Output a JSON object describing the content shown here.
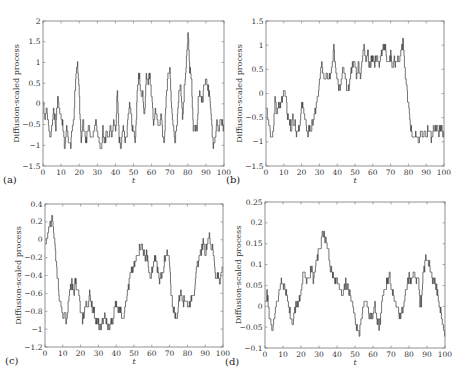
{
  "figure": {
    "panels": [
      "a",
      "b",
      "c",
      "d"
    ]
  },
  "chart_data": [
    {
      "type": "line",
      "panel_label": "(a)",
      "title": "",
      "xlabel": "t",
      "ylabel": "Diffusion-scaled process",
      "xlim": [
        0,
        100
      ],
      "ylim": [
        -1.5,
        2
      ],
      "xticks": [
        0,
        10,
        20,
        30,
        40,
        50,
        60,
        70,
        80,
        90,
        100
      ],
      "yticks": [
        -1.5,
        -1,
        -0.5,
        0,
        0.5,
        1,
        1.5,
        2
      ],
      "ytick_labels": [
        "-1.5",
        "-1",
        "-0.5",
        "0",
        "0.5",
        "1",
        "1.5",
        "2"
      ],
      "grid": false,
      "frame": [
        43,
        21,
        224,
        166
      ],
      "x": [
        0,
        1,
        2,
        3,
        4,
        5,
        6,
        7,
        8,
        9,
        10,
        11,
        12,
        13,
        14,
        15,
        16,
        17,
        18,
        19,
        20,
        21,
        22,
        23,
        24,
        25,
        26,
        27,
        28,
        29,
        30,
        31,
        32,
        33,
        34,
        35,
        36,
        37,
        38,
        39,
        40,
        41,
        42,
        43,
        44,
        45,
        46,
        47,
        48,
        49,
        50,
        51,
        52,
        53,
        54,
        55,
        56,
        57,
        58,
        59,
        60,
        61,
        62,
        63,
        64,
        65,
        66,
        67,
        68,
        69,
        70,
        71,
        72,
        73,
        74,
        75,
        76,
        77,
        78,
        79,
        80,
        81,
        82,
        83,
        84,
        85,
        86,
        87,
        88,
        89,
        90,
        91,
        92,
        93,
        94,
        95,
        96,
        97,
        98,
        99,
        100
      ],
      "values": [
        0.1,
        -0.3,
        -0.1,
        -0.5,
        -0.9,
        -0.4,
        -0.2,
        -0.6,
        0.2,
        -0.1,
        -0.3,
        -0.6,
        -1.1,
        -0.5,
        -0.8,
        -1.1,
        -0.6,
        -0.3,
        0.7,
        0.9,
        0.2,
        -0.9,
        -0.4,
        -0.7,
        -0.9,
        -0.5,
        -0.7,
        -0.9,
        -0.6,
        -0.4,
        -0.7,
        -0.9,
        -1.1,
        -0.6,
        -0.9,
        -0.7,
        -0.9,
        -0.5,
        -0.7,
        -0.4,
        -0.7,
        0.3,
        -0.9,
        -1.1,
        -0.6,
        -0.8,
        -0.9,
        -0.3,
        0.0,
        -0.5,
        -0.6,
        -0.9,
        0.4,
        0.7,
        0.3,
        0.2,
        -0.3,
        0.8,
        0.5,
        0.7,
        0.2,
        -0.5,
        -0.1,
        -0.4,
        -0.6,
        -0.2,
        -0.7,
        -0.9,
        0.2,
        0.6,
        0.9,
        -0.2,
        -0.6,
        -0.9,
        -0.5,
        0.3,
        0.5,
        -0.4,
        0.4,
        0.9,
        1.7,
        0.9,
        0.6,
        -0.7,
        -0.5,
        -0.7,
        0.3,
        0.2,
        0.0,
        0.5,
        0.7,
        0.3,
        0.3,
        -0.3,
        -1.0,
        -0.9,
        -0.4,
        -0.7,
        -0.3,
        -0.5,
        -0.6
      ]
    },
    {
      "type": "line",
      "panel_label": "(b)",
      "title": "",
      "xlabel": "t",
      "ylabel": "Diffusion-scaled process",
      "xlim": [
        0,
        100
      ],
      "ylim": [
        -1.5,
        1.5
      ],
      "xticks": [
        0,
        10,
        20,
        30,
        40,
        50,
        60,
        70,
        80,
        90,
        100
      ],
      "yticks": [
        -1.5,
        -1,
        -0.5,
        0,
        0.5,
        1,
        1.5
      ],
      "ytick_labels": [
        "-1.5",
        "-1",
        "-0.5",
        "0",
        "0.5",
        "1",
        "1.5"
      ],
      "grid": false,
      "frame": [
        266,
        21,
        444,
        166
      ],
      "x": [
        0,
        1,
        2,
        3,
        4,
        5,
        6,
        7,
        8,
        9,
        10,
        11,
        12,
        13,
        14,
        15,
        16,
        17,
        18,
        19,
        20,
        21,
        22,
        23,
        24,
        25,
        26,
        27,
        28,
        29,
        30,
        31,
        32,
        33,
        34,
        35,
        36,
        37,
        38,
        39,
        40,
        41,
        42,
        43,
        44,
        45,
        46,
        47,
        48,
        49,
        50,
        51,
        52,
        53,
        54,
        55,
        56,
        57,
        58,
        59,
        60,
        61,
        62,
        63,
        64,
        65,
        66,
        67,
        68,
        69,
        70,
        71,
        72,
        73,
        74,
        75,
        76,
        77,
        78,
        79,
        80,
        81,
        82,
        83,
        84,
        85,
        86,
        87,
        88,
        89,
        90,
        91,
        92,
        93,
        94,
        95,
        96,
        97,
        98,
        99,
        100
      ],
      "values": [
        -0.2,
        -0.5,
        -0.7,
        -0.9,
        -0.8,
        -0.2,
        -0.4,
        -0.3,
        -0.2,
        -0.1,
        0.1,
        0.0,
        -0.5,
        -0.6,
        -0.7,
        -0.5,
        -0.6,
        -0.8,
        -0.7,
        -0.6,
        -0.3,
        -0.3,
        -0.5,
        -0.9,
        -0.7,
        -0.8,
        -0.6,
        -0.5,
        -0.3,
        -0.1,
        0.2,
        0.6,
        0.4,
        0.3,
        0.5,
        0.3,
        0.4,
        0.6,
        0.9,
        0.5,
        0.3,
        0.1,
        0.2,
        0.5,
        0.4,
        0.2,
        0.0,
        0.3,
        0.5,
        0.7,
        0.5,
        0.4,
        0.6,
        0.4,
        0.6,
        1.1,
        0.7,
        0.9,
        0.5,
        0.7,
        0.8,
        0.6,
        0.8,
        0.6,
        0.7,
        0.8,
        1.0,
        0.9,
        0.7,
        0.6,
        0.8,
        0.5,
        0.7,
        0.6,
        0.7,
        0.7,
        0.9,
        1.1,
        0.5,
        0.1,
        -0.2,
        -0.6,
        -0.9,
        -0.9,
        -0.8,
        -0.9,
        -1.0,
        -0.8,
        -0.9,
        -0.8,
        -0.9,
        -0.7,
        -0.8,
        -0.9,
        -0.7,
        -0.8,
        -0.7,
        -0.8,
        -0.7,
        -0.8,
        -0.8
      ]
    },
    {
      "type": "line",
      "panel_label": "(c)",
      "title": "",
      "xlabel": "t",
      "ylabel": "Diffusion-scaled process",
      "xlim": [
        0,
        100
      ],
      "ylim": [
        -1.2,
        0.4
      ],
      "xticks": [
        0,
        10,
        20,
        30,
        40,
        50,
        60,
        70,
        80,
        90,
        100
      ],
      "yticks": [
        -1.2,
        -1,
        -0.8,
        -0.6,
        -0.4,
        -0.2,
        0,
        0.2,
        0.4
      ],
      "ytick_labels": [
        "-1.2",
        "-1",
        "-0.8",
        "-0.6",
        "-0.4",
        "-0.2",
        "0",
        "0.2",
        "0.4"
      ],
      "grid": false,
      "frame": [
        45,
        204,
        223,
        347
      ],
      "x": [
        0,
        1,
        2,
        3,
        4,
        5,
        6,
        7,
        8,
        9,
        10,
        11,
        12,
        13,
        14,
        15,
        16,
        17,
        18,
        19,
        20,
        21,
        22,
        23,
        24,
        25,
        26,
        27,
        28,
        29,
        30,
        31,
        32,
        33,
        34,
        35,
        36,
        37,
        38,
        39,
        40,
        41,
        42,
        43,
        44,
        45,
        46,
        47,
        48,
        49,
        50,
        51,
        52,
        53,
        54,
        55,
        56,
        57,
        58,
        59,
        60,
        61,
        62,
        63,
        64,
        65,
        66,
        67,
        68,
        69,
        70,
        71,
        72,
        73,
        74,
        75,
        76,
        77,
        78,
        79,
        80,
        81,
        82,
        83,
        84,
        85,
        86,
        87,
        88,
        89,
        90,
        91,
        92,
        93,
        94,
        95,
        96,
        97,
        98,
        99,
        100
      ],
      "values": [
        -0.1,
        0.05,
        0.1,
        0.2,
        0.25,
        0.0,
        -0.2,
        -0.45,
        -0.65,
        -0.75,
        -0.85,
        -0.8,
        -0.9,
        -0.75,
        -0.55,
        -0.5,
        -0.6,
        -0.45,
        -0.55,
        -0.6,
        -0.85,
        -0.9,
        -0.8,
        -0.7,
        -0.75,
        -0.6,
        -0.7,
        -0.8,
        -0.85,
        -0.9,
        -0.95,
        -1.0,
        -0.95,
        -0.85,
        -0.9,
        -0.95,
        -1.0,
        -0.9,
        -0.95,
        -0.75,
        -0.7,
        -0.8,
        -0.75,
        -0.85,
        -0.9,
        -0.7,
        -0.6,
        -0.5,
        -0.4,
        -0.35,
        -0.3,
        -0.25,
        -0.15,
        -0.1,
        -0.05,
        -0.1,
        -0.2,
        -0.15,
        -0.3,
        -0.45,
        -0.35,
        -0.25,
        -0.2,
        -0.3,
        -0.45,
        -0.4,
        -0.35,
        -0.25,
        -0.2,
        -0.15,
        -0.3,
        -0.65,
        -0.75,
        -0.85,
        -0.9,
        -0.7,
        -0.6,
        -0.65,
        -0.7,
        -0.65,
        -0.75,
        -0.7,
        -0.7,
        -0.6,
        -0.55,
        -0.35,
        -0.25,
        -0.15,
        -0.1,
        0.0,
        -0.15,
        -0.05,
        0.05,
        -0.1,
        -0.05,
        -0.25,
        -0.45,
        -0.4,
        -0.5,
        -0.35,
        -0.3
      ]
    },
    {
      "type": "line",
      "panel_label": "(d)",
      "title": "",
      "xlabel": "t",
      "ylabel": "Diffusion-scaled process",
      "xlim": [
        0,
        100
      ],
      "ylim": [
        -0.1,
        0.25
      ],
      "xticks": [
        0,
        10,
        20,
        30,
        40,
        50,
        60,
        70,
        80,
        90,
        100
      ],
      "yticks": [
        -0.1,
        -0.05,
        0,
        0.05,
        0.1,
        0.15,
        0.2,
        0.25
      ],
      "ytick_labels": [
        "-0.1",
        "-0.05",
        "0",
        "0.05",
        "0.1",
        "0.15",
        "0.2",
        "0.25"
      ],
      "grid": false,
      "frame": [
        265,
        202,
        445,
        348
      ],
      "x": [
        0,
        1,
        2,
        3,
        4,
        5,
        6,
        7,
        8,
        9,
        10,
        11,
        12,
        13,
        14,
        15,
        16,
        17,
        18,
        19,
        20,
        21,
        22,
        23,
        24,
        25,
        26,
        27,
        28,
        29,
        30,
        31,
        32,
        33,
        34,
        35,
        36,
        37,
        38,
        39,
        40,
        41,
        42,
        43,
        44,
        45,
        46,
        47,
        48,
        49,
        50,
        51,
        52,
        53,
        54,
        55,
        56,
        57,
        58,
        59,
        60,
        61,
        62,
        63,
        64,
        65,
        66,
        67,
        68,
        69,
        70,
        71,
        72,
        73,
        74,
        75,
        76,
        77,
        78,
        79,
        80,
        81,
        82,
        83,
        84,
        85,
        86,
        87,
        88,
        89,
        90,
        91,
        92,
        93,
        94,
        95,
        96,
        97,
        98,
        99,
        100
      ],
      "values": [
        0.0,
        0.03,
        -0.01,
        -0.04,
        -0.05,
        -0.03,
        0.0,
        0.02,
        0.04,
        0.06,
        0.05,
        0.04,
        0.03,
        0.01,
        -0.02,
        -0.04,
        -0.02,
        0.0,
        0.01,
        0.02,
        0.04,
        0.07,
        0.08,
        0.06,
        0.07,
        0.08,
        0.09,
        0.06,
        0.1,
        0.12,
        0.14,
        0.15,
        0.18,
        0.17,
        0.16,
        0.13,
        0.1,
        0.08,
        0.07,
        0.06,
        0.07,
        0.05,
        0.04,
        0.03,
        0.05,
        0.06,
        0.04,
        0.03,
        0.01,
        -0.01,
        -0.03,
        -0.05,
        -0.07,
        -0.05,
        -0.02,
        0.01,
        0.02,
        -0.01,
        -0.02,
        -0.03,
        -0.02,
        0.0,
        -0.03,
        -0.05,
        -0.04,
        0.02,
        0.04,
        0.05,
        0.06,
        0.08,
        0.04,
        0.03,
        0.02,
        0.0,
        -0.01,
        -0.02,
        -0.01,
        0.0,
        0.03,
        0.05,
        0.07,
        0.06,
        0.07,
        0.08,
        0.06,
        0.08,
        0.0,
        0.02,
        0.08,
        0.11,
        0.12,
        0.1,
        0.08,
        0.07,
        0.06,
        0.05,
        0.02,
        0.0,
        -0.03,
        -0.05,
        -0.07
      ]
    }
  ]
}
